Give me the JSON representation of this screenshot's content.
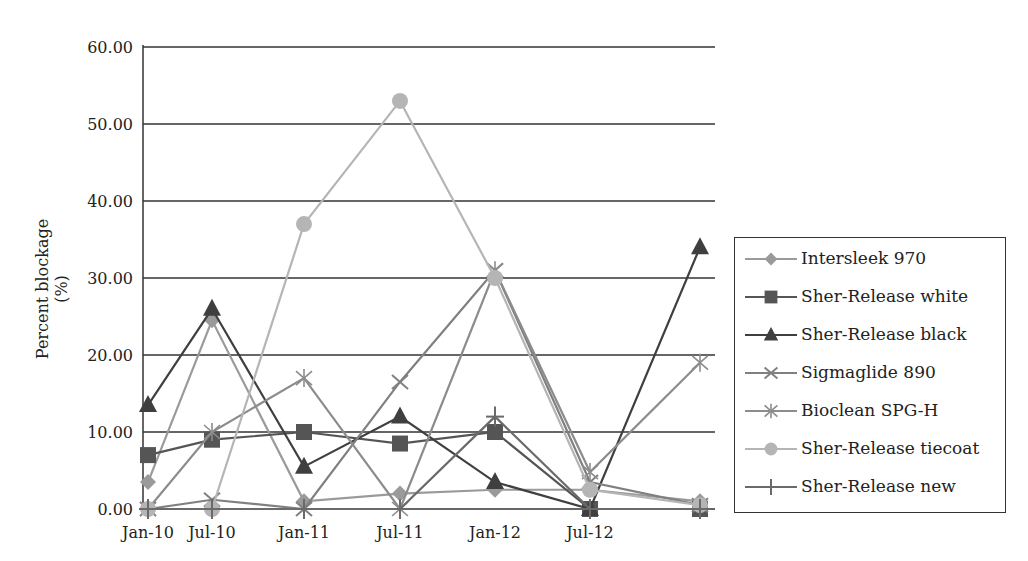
{
  "chart_data": {
    "type": "line",
    "title": "",
    "xlabel": "",
    "ylabel": "Percent blockage (%)",
    "ylim": [
      0,
      60
    ],
    "yticks": [
      "0.00",
      "10.00",
      "20.00",
      "30.00",
      "40.00",
      "50.00",
      "60.00"
    ],
    "xticks": [
      "Jan-10",
      "Jul-10",
      "Jan-11",
      "Jul-11",
      "Jan-12",
      "Jul-12"
    ],
    "x": [
      "Jan-10",
      "Jul-10",
      "Jan-11",
      "Jul-11",
      "Jan-12",
      "Jul-12",
      "Jan-13"
    ],
    "grid": true,
    "legend_position": "right",
    "series": [
      {
        "name": "Intersleek 970",
        "marker": "diamond",
        "color": "#9a9a9a",
        "values": [
          3.5,
          24.5,
          1.0,
          2.0,
          2.5,
          2.5,
          1.0
        ]
      },
      {
        "name": "Sher-Release white",
        "marker": "square",
        "color": "#555555",
        "values": [
          7.0,
          9.0,
          10.0,
          8.5,
          10.0,
          0.0,
          0.0
        ]
      },
      {
        "name": "Sher-Release black",
        "marker": "triangle",
        "color": "#3f3f3f",
        "values": [
          13.5,
          26.0,
          5.5,
          12.0,
          3.5,
          0.0,
          34.0
        ]
      },
      {
        "name": "Sigmaglide 890",
        "marker": "x",
        "color": "#808080",
        "values": [
          0.0,
          1.2,
          0.0,
          16.5,
          31.0,
          3.5,
          0.5
        ]
      },
      {
        "name": "Bioclean SPG-H",
        "marker": "star",
        "color": "#8c8c8c",
        "values": [
          0.0,
          10.0,
          17.0,
          0.0,
          31.0,
          4.8,
          19.0
        ]
      },
      {
        "name": "Sher-Release tiecoat",
        "marker": "circle",
        "color": "#b5b5b5",
        "values": [
          0.0,
          0.0,
          37.0,
          53.0,
          30.0,
          2.5,
          0.5
        ]
      },
      {
        "name": "Sher-Release new",
        "marker": "plus",
        "color": "#6a6a6a",
        "values": [
          0.0,
          0.0,
          0.0,
          0.0,
          12.0,
          0.0,
          0.0
        ]
      }
    ]
  },
  "legend": {
    "items": [
      {
        "label": "Intersleek 970"
      },
      {
        "label": "Sher-Release white"
      },
      {
        "label": "Sher-Release black"
      },
      {
        "label": "Sigmaglide 890"
      },
      {
        "label": "Bioclean SPG-H"
      },
      {
        "label": "Sher-Release tiecoat"
      },
      {
        "label": "Sher-Release new"
      }
    ]
  }
}
